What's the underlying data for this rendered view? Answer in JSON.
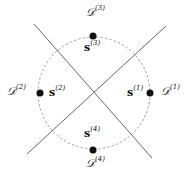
{
  "diagram": {
    "center": [
      94,
      93
    ],
    "radius": 56,
    "circle_style": "dashed",
    "lines": [
      {
        "from": [
          34,
          24
        ],
        "to": [
          152,
          158
        ]
      },
      {
        "from": [
          27,
          154
        ],
        "to": [
          166,
          26
        ]
      }
    ],
    "points": [
      {
        "id": 1,
        "pos": [
          150,
          93
        ],
        "s_label": "s",
        "d_label": "𝒟",
        "sup": "(1)"
      },
      {
        "id": 2,
        "pos": [
          40,
          93
        ],
        "s_label": "s",
        "d_label": "𝒟",
        "sup": "(2)"
      },
      {
        "id": 3,
        "pos": [
          93,
          36
        ],
        "s_label": "s",
        "d_label": "𝒟",
        "sup": "(3)"
      },
      {
        "id": 4,
        "pos": [
          93,
          150
        ],
        "s_label": "s",
        "d_label": "𝒟",
        "sup": "(4)"
      }
    ],
    "colors": {
      "line": "#555555",
      "circle": "#888888",
      "dot": "#111111"
    }
  }
}
